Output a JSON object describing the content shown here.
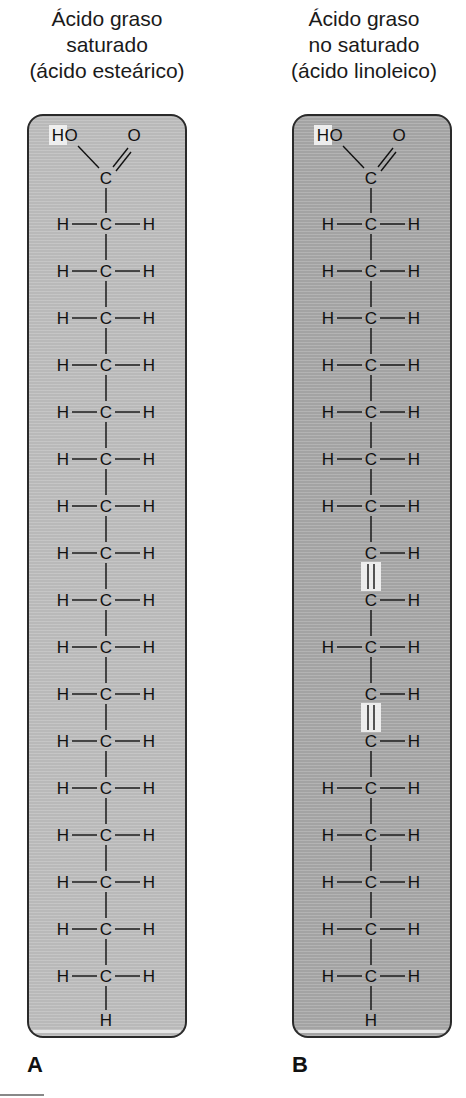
{
  "panels": [
    {
      "id": "A",
      "label": "A",
      "title_line1": "Ácido graso",
      "title_line2": "saturado",
      "title_line3": "(ácido esteárico)",
      "background": "#b9b9b9",
      "head": {
        "hydroxyl_H": "H",
        "hydroxyl_O": "O",
        "carbonyl_O": "O",
        "carbon": "C"
      },
      "chain": [
        {
          "left": "H",
          "carbon": "C",
          "right": "H",
          "bond_above": "single"
        },
        {
          "left": "H",
          "carbon": "C",
          "right": "H",
          "bond_above": "single"
        },
        {
          "left": "H",
          "carbon": "C",
          "right": "H",
          "bond_above": "single"
        },
        {
          "left": "H",
          "carbon": "C",
          "right": "H",
          "bond_above": "single"
        },
        {
          "left": "H",
          "carbon": "C",
          "right": "H",
          "bond_above": "single"
        },
        {
          "left": "H",
          "carbon": "C",
          "right": "H",
          "bond_above": "single"
        },
        {
          "left": "H",
          "carbon": "C",
          "right": "H",
          "bond_above": "single"
        },
        {
          "left": "H",
          "carbon": "C",
          "right": "H",
          "bond_above": "single"
        },
        {
          "left": "H",
          "carbon": "C",
          "right": "H",
          "bond_above": "single"
        },
        {
          "left": "H",
          "carbon": "C",
          "right": "H",
          "bond_above": "single"
        },
        {
          "left": "H",
          "carbon": "C",
          "right": "H",
          "bond_above": "single"
        },
        {
          "left": "H",
          "carbon": "C",
          "right": "H",
          "bond_above": "single"
        },
        {
          "left": "H",
          "carbon": "C",
          "right": "H",
          "bond_above": "single"
        },
        {
          "left": "H",
          "carbon": "C",
          "right": "H",
          "bond_above": "single"
        },
        {
          "left": "H",
          "carbon": "C",
          "right": "H",
          "bond_above": "single"
        },
        {
          "left": "H",
          "carbon": "C",
          "right": "H",
          "bond_above": "single"
        },
        {
          "left": "H",
          "carbon": "C",
          "right": "H",
          "bond_above": "single"
        }
      ],
      "tail": "H"
    },
    {
      "id": "B",
      "label": "B",
      "title_line1": "Ácido graso",
      "title_line2": "no saturado",
      "title_line3": "(ácido linoleico)",
      "background": "#a3a3a3",
      "head": {
        "hydroxyl_H": "H",
        "hydroxyl_O": "O",
        "carbonyl_O": "O",
        "carbon": "C"
      },
      "chain": [
        {
          "left": "H",
          "carbon": "C",
          "right": "H",
          "bond_above": "single"
        },
        {
          "left": "H",
          "carbon": "C",
          "right": "H",
          "bond_above": "single"
        },
        {
          "left": "H",
          "carbon": "C",
          "right": "H",
          "bond_above": "single"
        },
        {
          "left": "H",
          "carbon": "C",
          "right": "H",
          "bond_above": "single"
        },
        {
          "left": "H",
          "carbon": "C",
          "right": "H",
          "bond_above": "single"
        },
        {
          "left": "H",
          "carbon": "C",
          "right": "H",
          "bond_above": "single"
        },
        {
          "left": "H",
          "carbon": "C",
          "right": "H",
          "bond_above": "single"
        },
        {
          "left": "",
          "carbon": "C",
          "right": "H",
          "bond_above": "single"
        },
        {
          "left": "",
          "carbon": "C",
          "right": "H",
          "bond_above": "double"
        },
        {
          "left": "H",
          "carbon": "C",
          "right": "H",
          "bond_above": "single"
        },
        {
          "left": "",
          "carbon": "C",
          "right": "H",
          "bond_above": "single"
        },
        {
          "left": "",
          "carbon": "C",
          "right": "H",
          "bond_above": "double"
        },
        {
          "left": "H",
          "carbon": "C",
          "right": "H",
          "bond_above": "single"
        },
        {
          "left": "H",
          "carbon": "C",
          "right": "H",
          "bond_above": "single"
        },
        {
          "left": "H",
          "carbon": "C",
          "right": "H",
          "bond_above": "single"
        },
        {
          "left": "H",
          "carbon": "C",
          "right": "H",
          "bond_above": "single"
        },
        {
          "left": "H",
          "carbon": "C",
          "right": "H",
          "bond_above": "single"
        }
      ],
      "tail": "H"
    }
  ],
  "highlight_color": "#f4f4f4"
}
